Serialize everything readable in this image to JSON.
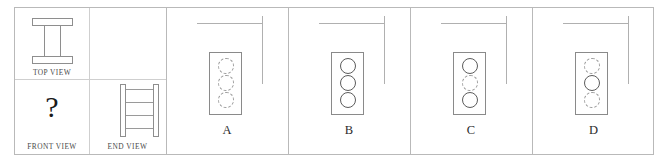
{
  "question": {
    "views": {
      "top": {
        "label": "TOP VIEW",
        "shape": "i-beam"
      },
      "front": {
        "label": "FRONT VIEW",
        "value": "?"
      },
      "end": {
        "label": "END VIEW",
        "shape": "ladder",
        "rungs": 4
      }
    }
  },
  "options": [
    {
      "letter": "A",
      "circles": [
        "hidden",
        "hidden",
        "hidden"
      ]
    },
    {
      "letter": "B",
      "circles": [
        "solid",
        "solid",
        "solid"
      ]
    },
    {
      "letter": "C",
      "circles": [
        "solid",
        "hidden",
        "solid"
      ]
    },
    {
      "letter": "D",
      "circles": [
        "hidden",
        "solid",
        "hidden"
      ]
    }
  ],
  "colors": {
    "frame": "#b9b9b9",
    "divider": "#cfcfcf",
    "outline": "#8a8a8a",
    "hidden_line": "#9a9a9a",
    "text": "#2b2b2b",
    "background": "#ffffff"
  }
}
